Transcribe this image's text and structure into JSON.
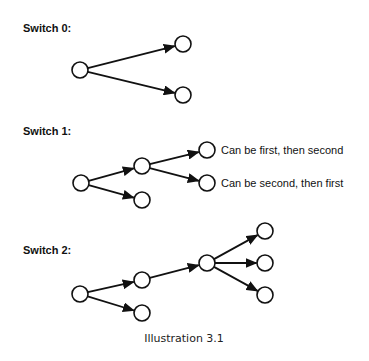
{
  "caption": "Illustration 3.1",
  "colors": {
    "stroke": "#111111",
    "background": "#ffffff"
  },
  "node_radius": 8,
  "switches": [
    {
      "title": "Switch 0:",
      "title_pos": [
        23,
        32
      ],
      "nodes": [
        {
          "id": "a",
          "x": 80,
          "y": 70
        },
        {
          "id": "b",
          "x": 183,
          "y": 44
        },
        {
          "id": "c",
          "x": 183,
          "y": 95
        }
      ],
      "edges": [
        [
          "a",
          "b"
        ],
        [
          "a",
          "c"
        ]
      ]
    },
    {
      "title": "Switch 1:",
      "title_pos": [
        23,
        135
      ],
      "nodes": [
        {
          "id": "a",
          "x": 81,
          "y": 183
        },
        {
          "id": "b",
          "x": 142,
          "y": 166
        },
        {
          "id": "c",
          "x": 142,
          "y": 200
        },
        {
          "id": "d",
          "x": 207,
          "y": 150,
          "label": "Can be first, then second"
        },
        {
          "id": "e",
          "x": 207,
          "y": 183,
          "label": "Can be second, then first"
        }
      ],
      "edges": [
        [
          "a",
          "b"
        ],
        [
          "a",
          "c"
        ],
        [
          "b",
          "d"
        ],
        [
          "b",
          "e"
        ]
      ]
    },
    {
      "title": "Switch 2:",
      "title_pos": [
        23,
        254
      ],
      "nodes": [
        {
          "id": "a",
          "x": 80,
          "y": 294
        },
        {
          "id": "b",
          "x": 142,
          "y": 280
        },
        {
          "id": "c",
          "x": 142,
          "y": 313
        },
        {
          "id": "d",
          "x": 207,
          "y": 263
        },
        {
          "id": "e",
          "x": 265,
          "y": 231
        },
        {
          "id": "f",
          "x": 265,
          "y": 263
        },
        {
          "id": "g",
          "x": 265,
          "y": 295
        }
      ],
      "edges": [
        [
          "a",
          "b"
        ],
        [
          "a",
          "c"
        ],
        [
          "b",
          "d"
        ],
        [
          "d",
          "e"
        ],
        [
          "d",
          "f"
        ],
        [
          "d",
          "g"
        ]
      ]
    }
  ]
}
